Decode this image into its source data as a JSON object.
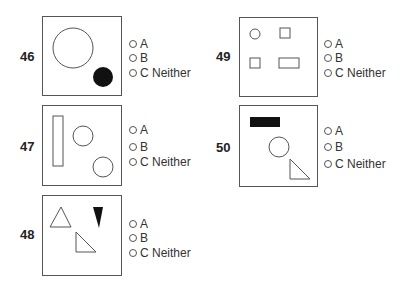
{
  "questions": [
    {
      "number": "46",
      "figure": "large hollow circle upper-left, small filled black circle lower-right",
      "options": [
        {
          "letter": "A",
          "label": "A"
        },
        {
          "letter": "B",
          "label": "B"
        },
        {
          "letter": "C",
          "label": "C Neither"
        }
      ]
    },
    {
      "number": "47",
      "figure": "tall hollow vertical rectangle left, two hollow circles diagonal",
      "options": [
        {
          "letter": "A",
          "label": "A"
        },
        {
          "letter": "B",
          "label": "B"
        },
        {
          "letter": "C",
          "label": "C Neither"
        }
      ]
    },
    {
      "number": "48",
      "figure": "hollow upward triangle, filled black downward triangle, hollow right triangle",
      "options": [
        {
          "letter": "A",
          "label": "A"
        },
        {
          "letter": "B",
          "label": "B"
        },
        {
          "letter": "C",
          "label": "C Neither"
        }
      ]
    },
    {
      "number": "49",
      "figure": "small circle, two small squares, hollow horizontal rectangle",
      "options": [
        {
          "letter": "A",
          "label": "A"
        },
        {
          "letter": "B",
          "label": "B"
        },
        {
          "letter": "C",
          "label": "C Neither"
        }
      ]
    },
    {
      "number": "50",
      "figure": "filled black horizontal rectangle, hollow circle, hollow right triangle",
      "options": [
        {
          "letter": "A",
          "label": "A"
        },
        {
          "letter": "B",
          "label": "B"
        },
        {
          "letter": "C",
          "label": "C Neither"
        }
      ]
    }
  ],
  "colors": {
    "stroke": "#555555",
    "fill_black": "#111111",
    "text": "#222222"
  }
}
